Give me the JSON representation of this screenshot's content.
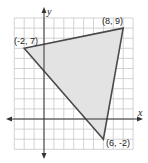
{
  "diagram": {
    "type": "coordinate-plane-triangle",
    "axes": {
      "x_label": "x",
      "y_label": "y"
    },
    "grid": {
      "x_range": [
        -3,
        9
      ],
      "y_range": [
        -3,
        10
      ],
      "step": 1
    },
    "vertices": [
      {
        "label": "(-2, 7)",
        "x": -2,
        "y": 7
      },
      {
        "label": "(8, 9)",
        "x": 8,
        "y": 9
      },
      {
        "label": "(6, -2)",
        "x": 6,
        "y": -2
      }
    ],
    "colors": {
      "fill": "#e3e3e3",
      "stroke": "#4a4a4a",
      "grid": "#c8c8c8",
      "axis": "#333333"
    }
  }
}
